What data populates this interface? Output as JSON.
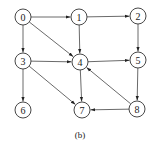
{
  "diagram": {
    "caption": "(b)",
    "node_radius": 8,
    "nodes": [
      {
        "id": "0",
        "label": "0",
        "x": 23,
        "y": 17
      },
      {
        "id": "1",
        "label": "1",
        "x": 79,
        "y": 17
      },
      {
        "id": "2",
        "label": "2",
        "x": 138,
        "y": 16
      },
      {
        "id": "3",
        "label": "3",
        "x": 23,
        "y": 61
      },
      {
        "id": "4",
        "label": "4",
        "x": 80,
        "y": 62
      },
      {
        "id": "5",
        "label": "5",
        "x": 138,
        "y": 60
      },
      {
        "id": "6",
        "label": "6",
        "x": 23,
        "y": 110
      },
      {
        "id": "7",
        "label": "7",
        "x": 82,
        "y": 110
      },
      {
        "id": "8",
        "label": "8",
        "x": 137,
        "y": 109
      }
    ],
    "edges": [
      {
        "from": "0",
        "to": "1"
      },
      {
        "from": "1",
        "to": "2"
      },
      {
        "from": "0",
        "to": "3"
      },
      {
        "from": "0",
        "to": "4"
      },
      {
        "from": "1",
        "to": "4"
      },
      {
        "from": "2",
        "to": "5"
      },
      {
        "from": "3",
        "to": "4"
      },
      {
        "from": "4",
        "to": "5"
      },
      {
        "from": "3",
        "to": "6"
      },
      {
        "from": "3",
        "to": "7"
      },
      {
        "from": "4",
        "to": "7"
      },
      {
        "from": "5",
        "to": "8"
      },
      {
        "from": "8",
        "to": "4"
      },
      {
        "from": "8",
        "to": "7"
      }
    ],
    "colors": {
      "stroke": "#333333",
      "text": "#222222",
      "background": "#ffffff"
    }
  }
}
